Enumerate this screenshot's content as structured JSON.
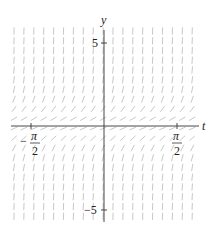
{
  "diagram": {
    "type": "slope-field",
    "axes": {
      "horizontal_label": "t",
      "vertical_label": "y",
      "y_ticks": [
        {
          "value": 5,
          "label": "5"
        },
        {
          "value": -5,
          "label": "−5"
        }
      ],
      "t_ticks": [
        {
          "value": -1.5708,
          "label_num": "π",
          "label_den": "2",
          "sign": "−"
        },
        {
          "value": 1.5708,
          "label_num": "π",
          "label_den": "2",
          "sign": ""
        }
      ],
      "t_range": [
        -2,
        2.3
      ],
      "y_range": [
        -6,
        6
      ]
    },
    "field": {
      "description": "Slope field; all slopes positive, shallow near y=0 and nearly vertical for large |y|",
      "columns": 19,
      "rows": 20,
      "segment_color": "#c8c8c8"
    },
    "colors": {
      "axis": "#333333",
      "segments": "#c8c8c8",
      "background": "#ffffff"
    }
  }
}
